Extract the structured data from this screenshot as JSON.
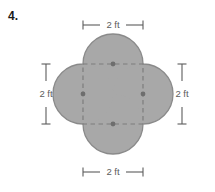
{
  "problem": {
    "number": "4."
  },
  "figure": {
    "name": "quatrefoil-with-inscribed-square",
    "fill_color": "#a8a8a8",
    "outline_color": "#8a8a8a",
    "dashed_color": "#7d7d7d",
    "dimension_color": "#5c5c5c",
    "square": {
      "left": 83,
      "top": 64,
      "size": 60
    },
    "lobe_radius": 30,
    "vertex_dots": [
      {
        "name": "top-edge-midpoint",
        "cx": 113,
        "cy": 64
      },
      {
        "name": "right-edge-midpoint",
        "cx": 143,
        "cy": 94
      },
      {
        "name": "bottom-edge-midpoint",
        "cx": 113,
        "cy": 124
      },
      {
        "name": "left-edge-midpoint",
        "cx": 83,
        "cy": 94
      }
    ]
  },
  "dimensions": {
    "top": {
      "label": "2 ft",
      "orientation": "horizontal",
      "x1": 83,
      "x2": 143,
      "y": 25
    },
    "bottom": {
      "label": "2 ft",
      "orientation": "horizontal",
      "x1": 83,
      "x2": 143,
      "y": 172
    },
    "left": {
      "label": "2 ft",
      "orientation": "vertical",
      "y1": 64,
      "y2": 124,
      "x": 46
    },
    "right": {
      "label": "2 ft",
      "orientation": "vertical",
      "y1": 64,
      "y2": 124,
      "x": 182
    }
  }
}
